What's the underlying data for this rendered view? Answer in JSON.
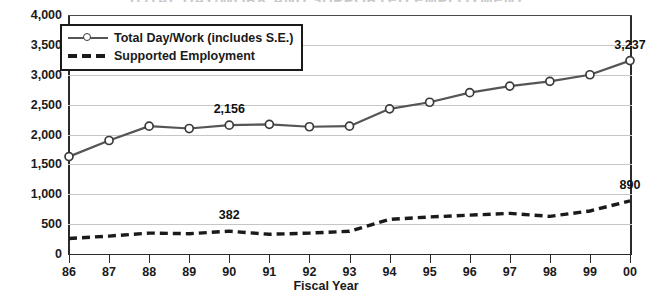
{
  "title": "TOTAL DAY/WORK AND SUPPORTED EMPLOYMENT",
  "axis": {
    "x_title": "Fiscal Year",
    "y_ticks": [
      "0",
      "500",
      "1,000",
      "1,500",
      "2,000",
      "2,500",
      "3,000",
      "3,500",
      "4,000"
    ],
    "x_ticks": [
      "86",
      "87",
      "88",
      "89",
      "90",
      "91",
      "92",
      "93",
      "94",
      "95",
      "96",
      "97",
      "98",
      "99",
      "00"
    ]
  },
  "legend": {
    "position": "top-left-inside",
    "items": [
      {
        "label": "Total Day/Work (includes S.E.)",
        "style": "solid-line-circle-marker"
      },
      {
        "label": "Supported Employment",
        "style": "dashed-line"
      }
    ]
  },
  "annotations": [
    {
      "text": "2,156",
      "series": "Total Day/Work (includes S.E.)",
      "x": "90",
      "y": 2156
    },
    {
      "text": "3,237",
      "series": "Total Day/Work (includes S.E.)",
      "x": "00",
      "y": 3237
    },
    {
      "text": "382",
      "series": "Supported Employment",
      "x": "90",
      "y": 382
    },
    {
      "text": "890",
      "series": "Supported Employment",
      "x": "00",
      "y": 890
    }
  ],
  "colors": {
    "solid_line": "#555555",
    "dashed_line": "#1a1a1a",
    "grid": "#c6c6c6",
    "axis": "#2b2b2b",
    "text": "#1a1a1a",
    "title": "#c9c9cc",
    "background": "#ffffff"
  },
  "chart_data": {
    "type": "line",
    "title": "TOTAL DAY/WORK AND SUPPORTED EMPLOYMENT",
    "xlabel": "Fiscal Year",
    "ylabel": "",
    "ylim": [
      0,
      4000
    ],
    "ytick_step": 500,
    "grid": true,
    "legend_position": "upper left",
    "categories": [
      "86",
      "87",
      "88",
      "89",
      "90",
      "91",
      "92",
      "93",
      "94",
      "95",
      "96",
      "97",
      "98",
      "99",
      "00"
    ],
    "series": [
      {
        "name": "Total Day/Work (includes S.E.)",
        "style": "solid",
        "marker": "circle",
        "values": [
          1630,
          1900,
          2140,
          2100,
          2156,
          2170,
          2130,
          2140,
          2430,
          2540,
          2700,
          2810,
          2890,
          3000,
          3237
        ]
      },
      {
        "name": "Supported Employment",
        "style": "dashed",
        "marker": "none",
        "values": [
          260,
          300,
          350,
          340,
          382,
          330,
          350,
          380,
          580,
          620,
          650,
          680,
          630,
          720,
          890
        ]
      }
    ]
  }
}
